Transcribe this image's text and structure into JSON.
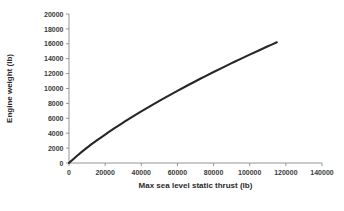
{
  "chart_data": {
    "type": "line",
    "title": "",
    "xlabel": "Max sea level static thrust (lb)",
    "ylabel": "Engine weight (lb)",
    "xlim": [
      0,
      140000
    ],
    "ylim": [
      0,
      20000
    ],
    "grid": false,
    "legend": "none",
    "xticks": [
      0,
      20000,
      40000,
      60000,
      80000,
      100000,
      120000,
      140000
    ],
    "yticks": [
      0,
      2000,
      4000,
      6000,
      8000,
      10000,
      12000,
      14000,
      16000,
      18000,
      20000
    ],
    "xtick_labels": [
      "0",
      "20000",
      "40000",
      "60000",
      "80000",
      "100000",
      "120000",
      "140000"
    ],
    "ytick_labels": [
      "0",
      "2000",
      "4000",
      "6000",
      "8000",
      "10000",
      "12000",
      "14000",
      "16000",
      "18000",
      "20000"
    ],
    "series": [
      {
        "name": "Engine weight vs thrust",
        "color": "#262626",
        "x": [
          0,
          5000,
          10000,
          15000,
          20000,
          25000,
          30000,
          35000,
          40000,
          45000,
          50000,
          55000,
          60000,
          65000,
          70000,
          75000,
          80000,
          85000,
          90000,
          95000,
          100000,
          105000,
          110000,
          115000
        ],
        "y": [
          0,
          1080,
          2060,
          2960,
          3820,
          4640,
          5430,
          6190,
          6930,
          7640,
          8340,
          9020,
          9690,
          10340,
          10980,
          11600,
          12210,
          12810,
          13400,
          13980,
          14550,
          15110,
          15660,
          16200
        ]
      }
    ],
    "annotations": []
  },
  "caption": {
    "text": ""
  },
  "icons": {
    "x_axis": "horizontal-axis",
    "y_axis": "vertical-axis"
  }
}
